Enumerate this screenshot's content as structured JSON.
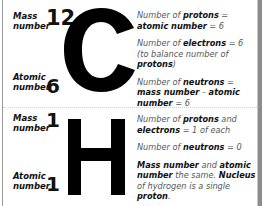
{
  "carbon": {
    "symbol": "C",
    "mass_label_1": "Mass",
    "mass_label_2": "number",
    "mass_number": "12",
    "atomic_label_1": "Atomic",
    "atomic_label_2": "number",
    "atomic_number": "6",
    "facts": [
      {
        "parts": [
          {
            "t": "Number of ",
            "b": false
          },
          {
            "t": "protons",
            "b": true
          },
          {
            "t": " = ",
            "b": false
          },
          {
            "t": "atomic number",
            "b": true
          },
          {
            "t": " = 6",
            "b": false
          }
        ]
      },
      {
        "parts": [
          {
            "t": "Number of ",
            "b": false
          },
          {
            "t": "electrons",
            "b": true
          },
          {
            "t": " = 6 (to balance number of ",
            "b": false
          },
          {
            "t": "protons",
            "b": true
          },
          {
            "t": ")",
            "b": false
          }
        ]
      },
      {
        "parts": [
          {
            "t": "Number of ",
            "b": false
          },
          {
            "t": "neutrons",
            "b": true
          },
          {
            "t": " = ",
            "b": false
          },
          {
            "t": "mass number",
            "b": true
          },
          {
            "t": " – ",
            "b": false
          },
          {
            "t": "atomic number",
            "b": true
          },
          {
            "t": " = 6",
            "b": false
          }
        ]
      }
    ]
  },
  "hydrogen": {
    "symbol": "H",
    "mass_label_1": "Mass",
    "mass_label_2": "number",
    "mass_number": "1",
    "atomic_label_1": "Atomic",
    "atomic_label_2": "number",
    "atomic_number": "1",
    "facts": [
      {
        "parts": [
          {
            "t": "Number of ",
            "b": false
          },
          {
            "t": "protons",
            "b": true
          },
          {
            "t": " and ",
            "b": false
          },
          {
            "t": "electrons",
            "b": true
          },
          {
            "t": " = 1 of each",
            "b": false
          }
        ]
      },
      {
        "parts": [
          {
            "t": "Number of ",
            "b": false
          },
          {
            "t": "neutrons",
            "b": true
          },
          {
            "t": " = 0",
            "b": false
          }
        ]
      },
      {
        "parts": [
          {
            "t": "Mass number",
            "b": true
          },
          {
            "t": " and ",
            "b": false
          },
          {
            "t": "atomic number",
            "b": true
          },
          {
            "t": " the same. ",
            "b": false
          },
          {
            "t": "Nucleus",
            "b": true
          },
          {
            "t": " of hydrogen is a single ",
            "b": false
          },
          {
            "t": "proton",
            "b": true
          },
          {
            "t": ".",
            "b": false
          }
        ]
      }
    ]
  }
}
